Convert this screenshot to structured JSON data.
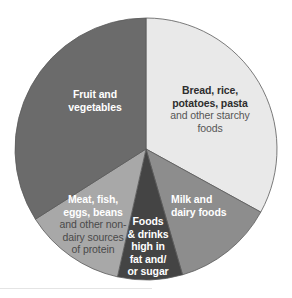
{
  "chart_data": {
    "type": "pie",
    "title": "",
    "start_angle_deg": 0,
    "direction": "clockwise",
    "categories": [
      "Bread, rice, potatoes, pasta and other starchy foods",
      "Milk and dairy foods",
      "Foods & drinks high in fat and/or sugar",
      "Meat, fish, eggs, beans and other non-dairy sources of protein",
      "Fruit and vegetables"
    ],
    "values": [
      33,
      12.5,
      8,
      12.5,
      34
    ],
    "unit": "%",
    "legend": "none (labels inside slices)"
  },
  "slices": [
    {
      "id": "bread",
      "main": "Bread, rice, potatoes, pasta",
      "sub": "and other starchy foods",
      "value": 33,
      "color": "#e9e9e9",
      "text_color": "#333333"
    },
    {
      "id": "milk",
      "main": "Milk and dairy foods",
      "sub": "",
      "value": 12.5,
      "color": "#8d8d8d",
      "text_color": "#ffffff"
    },
    {
      "id": "fatsugar",
      "main": "Foods & drinks high in fat and/ or sugar",
      "sub": "",
      "value": 8,
      "color": "#444444",
      "text_color": "#ffffff"
    },
    {
      "id": "protein",
      "main": "Meat, fish, eggs, beans",
      "sub": "and other non-dairy sources of protein",
      "value": 12.5,
      "color": "#a8a8a8",
      "text_color": "#ffffff",
      "sub_color": "#555555"
    },
    {
      "id": "fruitveg",
      "main": "Fruit and vegetables",
      "sub": "",
      "value": 34,
      "color": "#6b6b6b",
      "text_color": "#ffffff"
    }
  ],
  "labels": {
    "bread": {
      "line1": "Bread, rice,",
      "line2": "potatoes, pasta",
      "sub1": "and other starchy",
      "sub2": "foods"
    },
    "milk": {
      "line1": "Milk and",
      "line2": "dairy foods"
    },
    "fatsugar": {
      "line1": "Foods",
      "line2": "& drinks",
      "line3": "high in",
      "line4": "fat and/",
      "line5": "or sugar"
    },
    "protein": {
      "line1": "Meat, fish,",
      "line2": "eggs, beans",
      "sub1": "and other non-",
      "sub2": "dairy sources",
      "sub3": "of protein"
    },
    "fruitveg": {
      "line1": "Fruit and",
      "line2": "vegetables"
    }
  },
  "geometry": {
    "cx": 146,
    "cy": 149,
    "r": 131,
    "stroke": "#5a5a5a"
  }
}
